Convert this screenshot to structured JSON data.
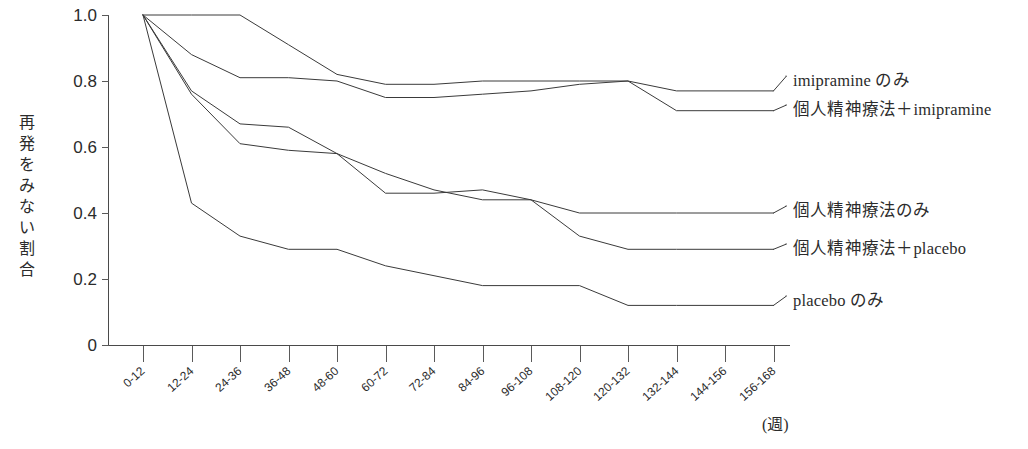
{
  "chart_data": {
    "type": "line",
    "title": "",
    "xlabel": "(週)",
    "ylabel": "再発をみない割合",
    "ylim": [
      0,
      1.0
    ],
    "grid": false,
    "legend_position": "right-inline",
    "yticks": [
      "1.0",
      "0.8",
      "0.6",
      "0.4",
      "0.2",
      "0"
    ],
    "ytick_values": [
      1.0,
      0.8,
      0.6,
      0.4,
      0.2,
      0
    ],
    "categories": [
      "0-12",
      "12-24",
      "24-36",
      "36-48",
      "48-60",
      "60-72",
      "72-84",
      "84-96",
      "96-108",
      "108-120",
      "120-132",
      "132-144",
      "144-156",
      "156-168"
    ],
    "series": [
      {
        "name": "imipramine のみ",
        "values": [
          1.0,
          1.0,
          1.0,
          0.91,
          0.82,
          0.79,
          0.79,
          0.8,
          0.8,
          0.8,
          0.8,
          0.77,
          0.77,
          0.77
        ]
      },
      {
        "name": "個人精神療法＋imipramine",
        "values": [
          1.0,
          0.88,
          0.81,
          0.81,
          0.8,
          0.75,
          0.75,
          0.76,
          0.77,
          0.79,
          0.8,
          0.71,
          0.71,
          0.71
        ]
      },
      {
        "name": "個人精神療法のみ",
        "values": [
          1.0,
          0.77,
          0.67,
          0.66,
          0.58,
          0.46,
          0.46,
          0.47,
          0.44,
          0.4,
          0.4,
          0.4,
          0.4,
          0.4
        ]
      },
      {
        "name": "個人精神療法＋placebo",
        "values": [
          1.0,
          0.76,
          0.61,
          0.59,
          0.58,
          0.52,
          0.47,
          0.44,
          0.44,
          0.33,
          0.29,
          0.29,
          0.29,
          0.29
        ]
      },
      {
        "name": "placebo のみ",
        "values": [
          1.0,
          0.43,
          0.33,
          0.29,
          0.29,
          0.24,
          0.21,
          0.18,
          0.18,
          0.18,
          0.12,
          0.12,
          0.12,
          0.12
        ]
      }
    ]
  },
  "axis": {
    "y_label_chars": [
      "再",
      "発",
      "を",
      "み",
      "な",
      "い",
      "割",
      "合"
    ],
    "x_unit": "(週)"
  },
  "legend": {
    "entries": [
      {
        "label": "imipramine のみ"
      },
      {
        "label": "個人精神療法＋imipramine"
      },
      {
        "label": "個人精神療法のみ"
      },
      {
        "label": "個人精神療法＋placebo"
      },
      {
        "label": "placebo のみ"
      }
    ]
  }
}
